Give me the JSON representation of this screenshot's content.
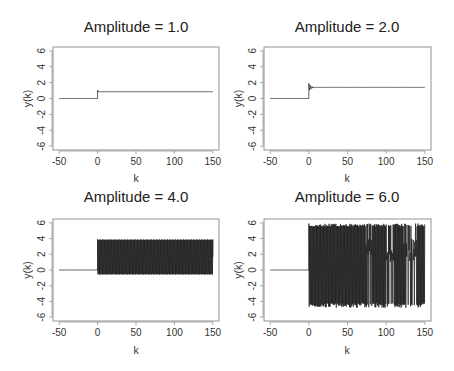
{
  "figure": {
    "background": "#ffffff",
    "line_color": "#1a1a1a",
    "frame_color": "#777777"
  },
  "chart_data": [
    {
      "type": "line",
      "title": "Amplitude = 1.0",
      "xlabel": "k",
      "ylabel": "y(k)",
      "xlim": [
        -50,
        150
      ],
      "ylim": [
        -6,
        6
      ],
      "xticks": [
        -50,
        0,
        50,
        100,
        150
      ],
      "yticks": [
        -6,
        -4,
        -2,
        0,
        2,
        4,
        6
      ],
      "grid": false,
      "series": [
        {
          "name": "y(k)",
          "description": "zero until k=0, step to ~1.0 with tiny overshoot, then constant ~0.85",
          "pre_step": 0,
          "step_at": 0,
          "steady_state": 0.85,
          "overshoot_peak": 1.05,
          "oscillation": "none",
          "osc_low": 0.85,
          "osc_high": 0.85
        }
      ]
    },
    {
      "type": "line",
      "title": "Amplitude = 2.0",
      "xlabel": "k",
      "ylabel": "y(k)",
      "xlim": [
        -50,
        150
      ],
      "ylim": [
        -6,
        6
      ],
      "xticks": [
        -50,
        0,
        50,
        100,
        150
      ],
      "yticks": [
        -6,
        -4,
        -2,
        0,
        2,
        4,
        6
      ],
      "grid": false,
      "series": [
        {
          "name": "y(k)",
          "description": "zero until k=0, step with damped ringing (peak ~1.9) settling to ~1.4 by k~10",
          "pre_step": 0,
          "step_at": 0,
          "steady_state": 1.4,
          "overshoot_peak": 1.9,
          "oscillation": "damped",
          "osc_low": 1.0,
          "osc_high": 1.9
        }
      ]
    },
    {
      "type": "line",
      "title": "Amplitude = 4.0",
      "xlabel": "k",
      "ylabel": "y(k)",
      "xlim": [
        -50,
        150
      ],
      "ylim": [
        -6,
        6
      ],
      "xticks": [
        -50,
        0,
        50,
        100,
        150
      ],
      "yticks": [
        -6,
        -4,
        -2,
        0,
        2,
        4,
        6
      ],
      "grid": false,
      "series": [
        {
          "name": "y(k)",
          "description": "zero until k=0, then sustained periodic oscillation between ~-0.6 and ~3.9, mean ~1.6",
          "pre_step": 0,
          "step_at": 0,
          "steady_state": 1.6,
          "overshoot_peak": 4.0,
          "oscillation": "sustained",
          "osc_low": -0.6,
          "osc_high": 3.9
        }
      ]
    },
    {
      "type": "line",
      "title": "Amplitude = 6.0",
      "xlabel": "k",
      "ylabel": "y(k)",
      "xlim": [
        -50,
        150
      ],
      "ylim": [
        -6,
        6
      ],
      "xticks": [
        -50,
        0,
        50,
        100,
        150
      ],
      "yticks": [
        -6,
        -4,
        -2,
        0,
        2,
        4,
        6
      ],
      "grid": false,
      "series": [
        {
          "name": "y(k)",
          "description": "zero until k=0, then large irregular (chaotic) oscillation between ~-4.8 and ~5.9",
          "pre_step": 0,
          "step_at": 0,
          "steady_state": 1.5,
          "overshoot_peak": 5.9,
          "oscillation": "chaotic",
          "osc_low": -4.8,
          "osc_high": 5.9
        }
      ]
    }
  ],
  "panels": [
    {
      "title": "Amplitude = 1.0",
      "xlabel": "k",
      "ylabel": "y(k)"
    },
    {
      "title": "Amplitude = 2.0",
      "xlabel": "k",
      "ylabel": "y(k)"
    },
    {
      "title": "Amplitude = 4.0",
      "xlabel": "k",
      "ylabel": "y(k)"
    },
    {
      "title": "Amplitude = 6.0",
      "xlabel": "k",
      "ylabel": "y(k)"
    }
  ]
}
